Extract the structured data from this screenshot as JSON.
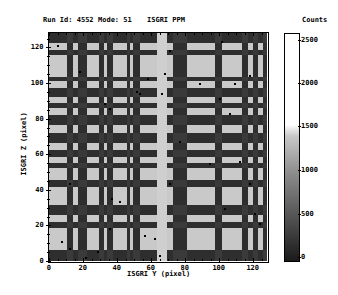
{
  "header": {
    "run_id": "Run Id: 4552",
    "mode": "Mode: 51",
    "instrument": "ISGRI PPM"
  },
  "colorbar": {
    "title": "Counts",
    "ticks": [
      {
        "label": "2500",
        "y": 40
      },
      {
        "label": "2000",
        "y": 83
      },
      {
        "label": "1500",
        "y": 126
      },
      {
        "label": "1000",
        "y": 170
      },
      {
        "label": "500",
        "y": 214
      },
      {
        "label": "0",
        "y": 257
      }
    ]
  },
  "chart_data": {
    "type": "heatmap",
    "xlabel": "ISGRI Y (pixel)",
    "ylabel": "ISGRI Z (pixel)",
    "xlim": [
      0,
      128
    ],
    "ylim": [
      0,
      128
    ],
    "x_ticks": [
      "0",
      "20",
      "40",
      "60",
      "80",
      "100",
      "120"
    ],
    "y_ticks": [
      "0",
      "20",
      "40",
      "60",
      "80",
      "100",
      "120"
    ],
    "colorbar_label": "Counts",
    "colorbar_range": [
      0,
      2500
    ],
    "colorbar_ticks": [
      0,
      500,
      1000,
      1500,
      2000,
      2500
    ],
    "colormap": "grayscale (dark=0, white>=1500)",
    "dark_columns_px": [
      [
        18,
        24
      ],
      [
        29,
        38
      ],
      [
        50,
        55
      ],
      [
        58,
        64
      ],
      [
        78,
        81
      ],
      [
        84,
        91
      ],
      [
        124,
        138
      ],
      [
        166,
        173
      ],
      [
        193,
        199
      ],
      [
        204,
        209
      ],
      [
        214,
        218
      ]
    ],
    "bright_column_px": [
      108,
      118
    ],
    "dark_rows_px": [
      [
        0,
        10
      ],
      [
        17,
        22
      ],
      [
        44,
        48
      ],
      [
        55,
        64
      ],
      [
        70,
        75
      ],
      [
        82,
        92
      ],
      [
        100,
        110
      ],
      [
        117,
        124
      ],
      [
        130,
        135
      ],
      [
        147,
        154
      ],
      [
        172,
        182
      ],
      [
        189,
        195
      ],
      [
        217,
        228
      ]
    ],
    "light_level": "#c9c9c9",
    "dark_level": "#2e2e2e",
    "mid_level": "#6a6a6a"
  }
}
